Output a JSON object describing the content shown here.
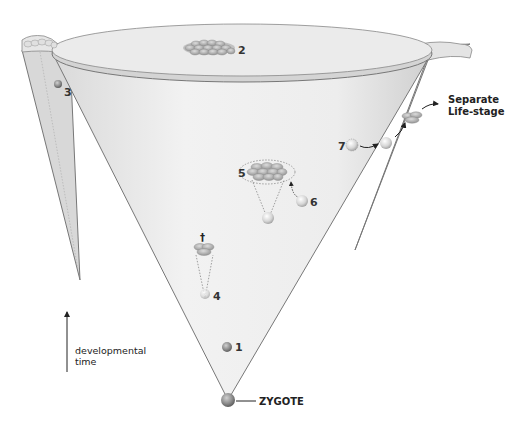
{
  "diagram": {
    "type": "developmental-cone",
    "labels": {
      "zygote": "ZYGOTE",
      "axis_line1": "developmental",
      "axis_line2": "time",
      "separate_line1": "Separate",
      "separate_line2": "Life-stage",
      "dagger": "†"
    },
    "markers": [
      {
        "id": "1",
        "label": "1"
      },
      {
        "id": "2",
        "label": "2"
      },
      {
        "id": "3",
        "label": "3"
      },
      {
        "id": "4",
        "label": "4"
      },
      {
        "id": "5",
        "label": "5"
      },
      {
        "id": "6",
        "label": "6"
      },
      {
        "id": "7",
        "label": "7"
      }
    ],
    "colors": {
      "cone_fill": "#ececec",
      "cone_stroke": "#777777",
      "rim_fill": "#e2e2e2",
      "cell_fill": "#b8b8b8",
      "cell_dark": "#8c8c8c",
      "text": "#222222"
    }
  }
}
